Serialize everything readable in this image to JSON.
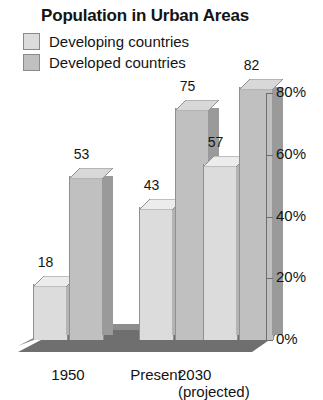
{
  "chart_data": {
    "type": "bar",
    "title": "Population in Urban Areas",
    "xlabel": "",
    "ylabel": "",
    "ylim": [
      0,
      80
    ],
    "ytick_labels": [
      "0%",
      "20%",
      "40%",
      "60%",
      "80%"
    ],
    "ytick_values": [
      0,
      20,
      40,
      60,
      80
    ],
    "grid": false,
    "legend_position": "top-left",
    "categories": [
      "1950",
      "Present",
      "2030"
    ],
    "category_sublabels": [
      "",
      "",
      "(projected)"
    ],
    "series": [
      {
        "name": "Developing countries",
        "color": "#dcdcdc",
        "side_color": "#b4b4b4",
        "top_color": "#ececec",
        "values": [
          18,
          43,
          57
        ]
      },
      {
        "name": "Developed countries",
        "color": "#c0c0c0",
        "side_color": "#9a9a9a",
        "top_color": "#d8d8d8",
        "values": [
          53,
          75,
          82
        ]
      }
    ],
    "data_labels": [
      "18",
      "53",
      "43",
      "75",
      "57",
      "82"
    ],
    "floor_color": "#6f6f6f",
    "axis_color": "#6d6d6d"
  },
  "legend": {
    "items": [
      {
        "label": "Developing countries"
      },
      {
        "label": "Developed countries"
      }
    ]
  },
  "axis": {
    "ticks": [
      {
        "label": "80%"
      },
      {
        "label": "60%"
      },
      {
        "label": "40%"
      },
      {
        "label": "20%"
      },
      {
        "label": "0%"
      }
    ]
  },
  "categories": [
    {
      "label": "1950",
      "sub": ""
    },
    {
      "label": "Present",
      "sub": ""
    },
    {
      "label": "2030",
      "sub": "(projected)"
    }
  ],
  "bars": [
    {
      "value_label": "18"
    },
    {
      "value_label": "53"
    },
    {
      "value_label": "43"
    },
    {
      "value_label": "75"
    },
    {
      "value_label": "57"
    },
    {
      "value_label": "82"
    }
  ]
}
